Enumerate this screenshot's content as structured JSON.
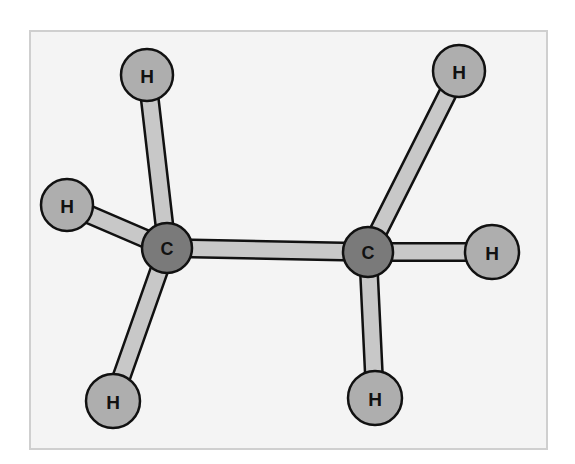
{
  "diagram": {
    "title": "",
    "type": "ball-and-stick molecular model",
    "molecule": "ethane",
    "frame": {
      "x": 30,
      "y": 31,
      "width": 517,
      "height": 418,
      "fill": "#f4f4f4",
      "stroke": "#cfcfcf"
    },
    "colors": {
      "carbon": "#7a7a7a",
      "hydrogen": "#aeaeae",
      "bond": "#c8c8c8",
      "outline": "#111111",
      "label": "#111111"
    },
    "atoms": [
      {
        "id": "c1",
        "element": "C",
        "label": "C",
        "x": 167,
        "y": 248,
        "r": 25
      },
      {
        "id": "c2",
        "element": "C",
        "label": "C",
        "x": 368,
        "y": 252,
        "r": 25
      },
      {
        "id": "h1",
        "element": "H",
        "label": "H",
        "x": 147,
        "y": 75,
        "r": 26
      },
      {
        "id": "h2",
        "element": "H",
        "label": "H",
        "x": 67,
        "y": 205,
        "r": 26
      },
      {
        "id": "h3",
        "element": "H",
        "label": "H",
        "x": 113,
        "y": 401,
        "r": 27
      },
      {
        "id": "h4",
        "element": "H",
        "label": "H",
        "x": 459,
        "y": 71,
        "r": 26
      },
      {
        "id": "h5",
        "element": "H",
        "label": "H",
        "x": 492,
        "y": 252,
        "r": 27
      },
      {
        "id": "h6",
        "element": "H",
        "label": "H",
        "x": 375,
        "y": 398,
        "r": 27
      }
    ],
    "bonds": [
      {
        "from": "c1",
        "to": "c2"
      },
      {
        "from": "c1",
        "to": "h1"
      },
      {
        "from": "c1",
        "to": "h2"
      },
      {
        "from": "c1",
        "to": "h3"
      },
      {
        "from": "c2",
        "to": "h4"
      },
      {
        "from": "c2",
        "to": "h5"
      },
      {
        "from": "c2",
        "to": "h6"
      }
    ]
  }
}
